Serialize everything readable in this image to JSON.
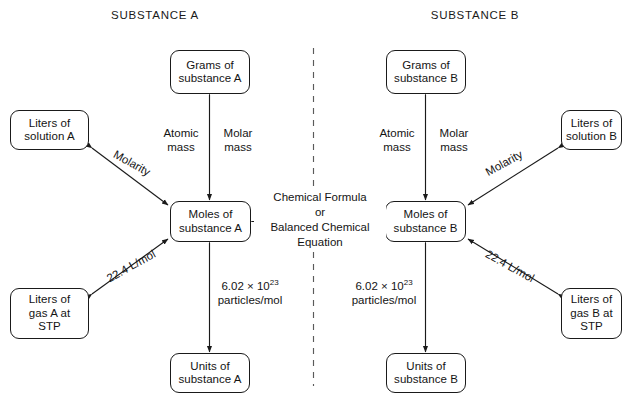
{
  "diagram": {
    "title_left": "SUBSTANCE A",
    "title_right": "SUBSTANCE B",
    "divider": "dashed-vertical-divider"
  },
  "nodes": {
    "grams_a": "Grams of\nsubstance A",
    "grams_a_l1": "Grams of",
    "grams_a_l2": "substance A",
    "solution_a_l1": "Liters of",
    "solution_a_l2": "solution A",
    "moles_a_l1": "Moles of",
    "moles_a_l2": "substance A",
    "gas_a_l1": "Liters of",
    "gas_a_l2": "gas A at",
    "gas_a_l3": "STP",
    "units_a_l1": "Units of",
    "units_a_l2": "substance A",
    "grams_b_l1": "Grams of",
    "grams_b_l2": "substance B",
    "solution_b_l1": "Liters of",
    "solution_b_l2": "solution B",
    "moles_b_l1": "Moles of",
    "moles_b_l2": "substance B",
    "gas_b_l1": "Liters of",
    "gas_b_l2": "gas B at",
    "gas_b_l3": "STP",
    "units_b_l1": "Units of",
    "units_b_l2": "substance B"
  },
  "edge_labels": {
    "atomic_mass_a_l1": "Atomic",
    "atomic_mass_a_l2": "mass",
    "molar_mass_a_l1": "Molar",
    "molar_mass_a_l2": "mass",
    "atomic_mass_b_l1": "Atomic",
    "atomic_mass_b_l2": "mass",
    "molar_mass_b_l1": "Molar",
    "molar_mass_b_l2": "mass",
    "molarity_a": "Molarity",
    "molarity_b": "Molarity",
    "molar_volume_a": "22.4 L/mol",
    "molar_volume_b": "22.4 L/mol",
    "avogadro_a_coeff": "6.02 × 10",
    "avogadro_a_exp": "23",
    "avogadro_a_unit": "particles/mol",
    "avogadro_b_coeff": "6.02 × 10",
    "avogadro_b_exp": "23",
    "avogadro_b_unit": "particles/mol",
    "center_l1": "Chemical Formula",
    "center_l2": "or",
    "center_l3": "Balanced Chemical",
    "center_l4": "Equation"
  },
  "colors": {
    "stroke": "#1a1a1a",
    "text": "#141414",
    "background": "#ffffff"
  }
}
